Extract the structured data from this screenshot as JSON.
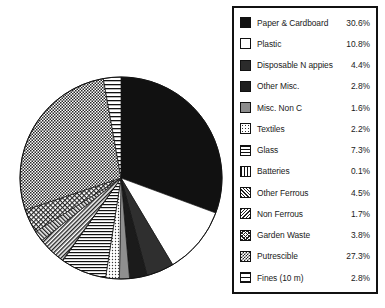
{
  "chart_data": {
    "type": "pie",
    "title": "",
    "subtitle": "",
    "xlabel": "",
    "ylabel": "",
    "legend_position": "right",
    "grid": false,
    "start_angle_oclock": 12,
    "direction": "clockwise",
    "units": "percent",
    "categories": [
      "Paper & Cardboard",
      "Plastic",
      "Disposable N appies",
      "Other Misc.",
      "Misc. Non C",
      "Textiles",
      "Glass",
      "Batteries",
      "Other Ferrous",
      "Non Ferrous",
      "Garden Waste",
      "Putrescible",
      "Fines (10 m)"
    ],
    "values": [
      30.6,
      10.8,
      4.4,
      2.8,
      1.6,
      2.2,
      7.3,
      0.1,
      4.5,
      1.7,
      3.8,
      27.3,
      2.8
    ],
    "value_labels": [
      "30.6%",
      "10.8%",
      "4.4%",
      "2.8%",
      "1.6%",
      "2.2%",
      "7.3%",
      "0.1%",
      "4.5%",
      "1.7%",
      "3.8%",
      "27.3%",
      "2.8%"
    ],
    "slice_patterns": [
      "solid-black",
      "white",
      "dark-1",
      "dark-2",
      "gray-mid",
      "dots-light",
      "hstripe",
      "vstripe",
      "diag-dense",
      "diag-back",
      "cross",
      "checker",
      "hstripe-wide"
    ]
  },
  "legend": {
    "items": [
      {
        "label": "Paper & Cardboard",
        "value": "30.6%",
        "swatch": "solid-black"
      },
      {
        "label": "Plastic",
        "value": "10.8%",
        "swatch": "white"
      },
      {
        "label": "Disposable N appies",
        "value": "4.4%",
        "swatch": "dark-1"
      },
      {
        "label": "Other Misc.",
        "value": "2.8%",
        "swatch": "dark-2"
      },
      {
        "label": "Misc. Non C",
        "value": "1.6%",
        "swatch": "gray-mid"
      },
      {
        "label": "Textiles",
        "value": "2.2%",
        "swatch": "dots-light"
      },
      {
        "label": "Glass",
        "value": "7.3%",
        "swatch": "hstripe"
      },
      {
        "label": "Batteries",
        "value": "0.1%",
        "swatch": "vstripe"
      },
      {
        "label": "Other Ferrous",
        "value": "4.5%",
        "swatch": "diag-dense"
      },
      {
        "label": "Non Ferrous",
        "value": "1.7%",
        "swatch": "diag-back"
      },
      {
        "label": "Garden Waste",
        "value": "3.8%",
        "swatch": "cross"
      },
      {
        "label": "Putrescible",
        "value": "27.3%",
        "swatch": "checker"
      },
      {
        "label": "Fines (10 m)",
        "value": "2.8%",
        "swatch": "hstripe-wide"
      }
    ]
  },
  "colors": {
    "outline": "#111111",
    "background": "#ffffff",
    "text": "#1a1a1a"
  },
  "pie_geometry": {
    "cx": 121,
    "cy": 178,
    "r": 101
  }
}
